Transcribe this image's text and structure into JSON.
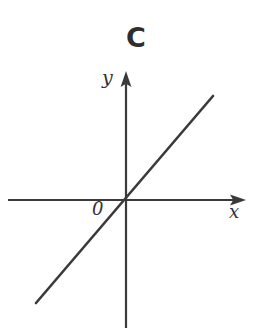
{
  "figure": {
    "panel_label": "C",
    "width": 262,
    "height": 334,
    "background_color": "#ffffff",
    "ink_color": "#3a3a3a",
    "text_color": "#333333"
  },
  "axes": {
    "origin_label": "0",
    "x_axis_label": "x",
    "y_axis_label": "y",
    "origin_px": {
      "x": 126,
      "y": 200
    },
    "x_axis_px": {
      "x1": 8,
      "y1": 200,
      "x2": 246,
      "y2": 200
    },
    "y_axis_px": {
      "x1": 126,
      "y1": 71,
      "x2": 126,
      "y2": 328
    },
    "x_arrow_at": "right",
    "y_arrow_at": "top",
    "stroke_width": 2.2
  },
  "chart_data": {
    "type": "line",
    "title": "C",
    "xlabel": "x",
    "ylabel": "y",
    "grid": false,
    "legend": null,
    "annotations": [
      "0"
    ],
    "xlim": [
      -2.15,
      2.15
    ],
    "ylim": [
      -2.9,
      2.9
    ],
    "series": [
      {
        "name": "line",
        "kind": "line",
        "slope": 1.17,
        "intercept": 0,
        "x": [
          -2.0,
          0.0,
          1.5
        ],
        "y": [
          -2.34,
          0.0,
          1.76
        ],
        "endpoints_px": [
          {
            "x": 36,
            "y": 303
          },
          {
            "x": 213,
            "y": 96
          }
        ],
        "color": "#3a3a3a",
        "stroke_width": 2.6
      }
    ]
  }
}
